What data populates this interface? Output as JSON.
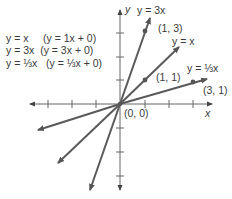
{
  "legend": {
    "rows": [
      {
        "lhs": "y = x",
        "rhs": "(y = 1x + 0)"
      },
      {
        "lhs": "y = 3x",
        "rhs": "(y = 3x + 0)"
      },
      {
        "lhs": "y = ⅓x",
        "rhs": "(y = ⅓x + 0)"
      }
    ]
  },
  "axes": {
    "x_label": "x",
    "y_label": "y",
    "origin_label": "(0, 0)"
  },
  "lines": [
    {
      "name": "y = 3x",
      "slope": 3,
      "label": "y = 3x",
      "point_label": "(1, 3)"
    },
    {
      "name": "y = x",
      "slope": 1,
      "label": "y = x",
      "point_label": "(1, 1)"
    },
    {
      "name": "y = 1/3 x",
      "slope": 0.3333,
      "label": "y = ⅓x",
      "point_label": "(3, 1)"
    }
  ],
  "colors": {
    "line": "#5a5a5a",
    "axis": "#555555",
    "text": "#3a3a3a"
  }
}
